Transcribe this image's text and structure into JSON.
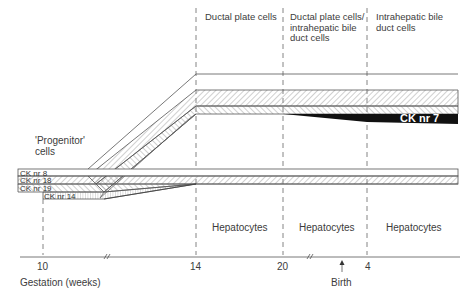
{
  "diagram": {
    "title": "",
    "stages": [
      {
        "label": "Ductal plate cells"
      },
      {
        "label": "Ductal plate cells/ intrahepatic bile duct cells"
      },
      {
        "label": "Intrahepatic bile duct cells"
      }
    ],
    "progenitor_label": "'Progenitor' cells",
    "hepatocytes": [
      "Hepatocytes",
      "Hepatocytes",
      "Hepatocytes"
    ],
    "keratins": {
      "ck8": "CK nr 8",
      "ck18": "CK nr 18",
      "ck19": "CK nr 19",
      "ck14": "CK nr 14",
      "ck7": "CK nr 7"
    },
    "axis": {
      "ticks": [
        "10",
        "14",
        "20",
        "4"
      ],
      "xlabel": "Gestation (weeks)",
      "birth_label": "Birth"
    },
    "colors": {
      "line": "#555555",
      "hatch": "#888888",
      "ck7_fill": "#111111"
    }
  }
}
